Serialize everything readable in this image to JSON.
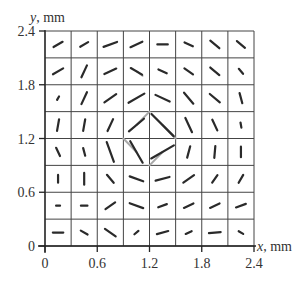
{
  "chart_data": {
    "type": "vector-field",
    "title": "",
    "xlabel": "x, mm",
    "ylabel": "y, mm",
    "xlim": [
      0,
      2.4
    ],
    "ylim": [
      0,
      2.4
    ],
    "xticks": [
      "0",
      "0.6",
      "1.2",
      "1.8",
      "2.4"
    ],
    "yticks": [
      "0",
      "0.6",
      "1.2",
      "1.8",
      "2.4"
    ],
    "grid": {
      "on": true,
      "cells_x": 8,
      "cells_y": 8,
      "step_mm": 0.3
    },
    "segment_centers_x": [
      0.15,
      0.45,
      0.75,
      1.05,
      1.35,
      1.65,
      1.95,
      2.25
    ],
    "rows": [
      {
        "y": 2.25,
        "angles_deg": [
          30,
          30,
          20,
          25,
          0,
          -25,
          -40,
          -40
        ],
        "lengths": [
          0.4,
          0.35,
          0.55,
          0.5,
          0.4,
          0.35,
          0.45,
          0.4
        ]
      },
      {
        "y": 1.95,
        "angles_deg": [
          30,
          65,
          25,
          -30,
          -25,
          -35,
          -40,
          -50
        ],
        "lengths": [
          0.45,
          0.5,
          0.5,
          0.5,
          0.35,
          0.4,
          0.45,
          0.25
        ]
      },
      {
        "y": 1.65,
        "angles_deg": [
          60,
          65,
          35,
          30,
          -25,
          -50,
          -40,
          -75
        ],
        "lengths": [
          0.15,
          0.5,
          0.55,
          0.7,
          0.6,
          0.55,
          0.5,
          0.4
        ]
      },
      {
        "y": 1.35,
        "angles_deg": [
          80,
          80,
          65,
          40,
          -45,
          -65,
          -65,
          -80
        ],
        "lengths": [
          0.45,
          0.45,
          0.5,
          0.75,
          1.2,
          0.6,
          0.45,
          0.2
        ]
      },
      {
        "y": 1.05,
        "angles_deg": [
          -65,
          -75,
          -70,
          -60,
          30,
          75,
          85,
          90
        ],
        "lengths": [
          0.35,
          0.3,
          0.8,
          0.95,
          1.0,
          0.45,
          0.45,
          0.4
        ]
      },
      {
        "y": 0.75,
        "angles_deg": [
          90,
          90,
          -50,
          -20,
          15,
          35,
          55,
          60
        ],
        "lengths": [
          0.3,
          0.45,
          0.4,
          0.55,
          0.55,
          0.5,
          0.35,
          0.35
        ]
      },
      {
        "y": 0.45,
        "angles_deg": [
          0,
          0,
          35,
          -20,
          20,
          25,
          25,
          20
        ],
        "lengths": [
          0.15,
          0.25,
          0.45,
          0.55,
          0.35,
          0.4,
          0.4,
          0.4
        ]
      },
      {
        "y": 0.15,
        "angles_deg": [
          0,
          -30,
          -35,
          40,
          15,
          25,
          5,
          -30
        ],
        "lengths": [
          0.4,
          0.3,
          0.5,
          0.2,
          0.45,
          0.25,
          0.45,
          0.2
        ]
      }
    ],
    "gray_links": [
      {
        "from": [
          1.05,
          1.35
        ],
        "to": [
          1.2,
          1.5
        ],
        "note": "gray tail of segment at (1.05,1.35) to grid node"
      },
      {
        "from": [
          1.35,
          1.35
        ],
        "to": [
          1.5,
          1.2
        ],
        "note": "gray tail of segment at (1.35,1.35)"
      },
      {
        "from": [
          0.9,
          1.2
        ],
        "to": [
          1.05,
          1.05
        ],
        "note": "gray tail of segment at (1.05,1.05)"
      },
      {
        "from": [
          1.2,
          0.9
        ],
        "to": [
          1.35,
          1.05
        ],
        "note": "gray tail of segment at (1.35,1.05)"
      },
      {
        "from": [
          1.05,
          1.95
        ],
        "to": [
          1.12,
          1.9
        ],
        "note": "gray stub at (1.05,1.95)"
      }
    ],
    "segment_color": "#2a2a2a",
    "gray_color": "#a8a8a8",
    "grid_color": "#444444"
  },
  "axes": {
    "x_label_var": "x",
    "x_label_unit": ", mm",
    "y_label_var": "y",
    "y_label_unit": ", mm"
  }
}
